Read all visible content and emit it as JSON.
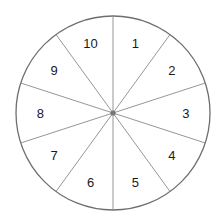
{
  "diagram": {
    "type": "spinner-wheel",
    "sections": 10,
    "center": [
      113,
      113
    ],
    "radius": 97,
    "colors": {
      "outline": "#6e6e6e",
      "divider": "#8a8a8a",
      "center_dot": "#777777",
      "fill": "#ffffff"
    },
    "labels": [
      "1",
      "2",
      "3",
      "4",
      "5",
      "6",
      "7",
      "8",
      "9",
      "10"
    ]
  }
}
